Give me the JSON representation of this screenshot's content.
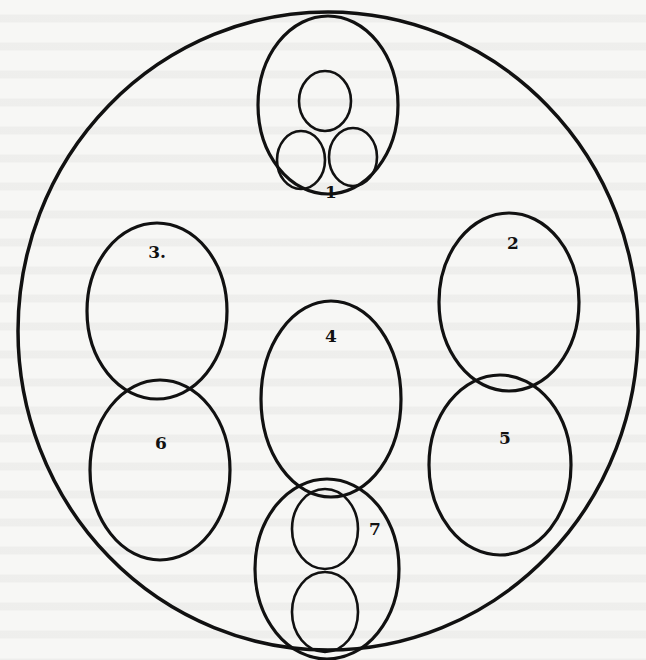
{
  "diagram": {
    "outer": {
      "cx": 328,
      "cy": 331,
      "rx": 310,
      "ry": 319,
      "stroke": 3.5
    },
    "circles": [
      {
        "id": "1",
        "label": "1",
        "cx": 328,
        "cy": 105,
        "rx": 70,
        "ry": 89,
        "label_x": 331,
        "label_y": 193,
        "inner": [
          {
            "cx": 325,
            "cy": 101,
            "rx": 26,
            "ry": 30
          },
          {
            "cx": 301,
            "cy": 160,
            "rx": 24,
            "ry": 29
          },
          {
            "cx": 353,
            "cy": 157,
            "rx": 24,
            "ry": 29
          }
        ]
      },
      {
        "id": "2",
        "label": "2",
        "cx": 509,
        "cy": 302,
        "rx": 70,
        "ry": 89,
        "label_x": 513,
        "label_y": 244
      },
      {
        "id": "3",
        "label": "3.",
        "cx": 157,
        "cy": 311,
        "rx": 70,
        "ry": 88,
        "label_x": 157,
        "label_y": 253
      },
      {
        "id": "4",
        "label": "4",
        "cx": 331,
        "cy": 399,
        "rx": 70,
        "ry": 98,
        "label_x": 331,
        "label_y": 337
      },
      {
        "id": "5",
        "label": "5",
        "cx": 500,
        "cy": 465,
        "rx": 71,
        "ry": 90,
        "label_x": 505,
        "label_y": 439
      },
      {
        "id": "6",
        "label": "6",
        "cx": 160,
        "cy": 470,
        "rx": 70,
        "ry": 90,
        "label_x": 161,
        "label_y": 444
      },
      {
        "id": "7",
        "label": "7",
        "cx": 327,
        "cy": 569,
        "rx": 72,
        "ry": 90,
        "label_x": 375,
        "label_y": 530,
        "inner": [
          {
            "cx": 325,
            "cy": 529,
            "rx": 33,
            "ry": 40
          },
          {
            "cx": 325,
            "cy": 612,
            "rx": 33,
            "ry": 40
          }
        ]
      }
    ]
  },
  "colors": {
    "ink": "#111111",
    "paper": "#f7f7f5"
  }
}
